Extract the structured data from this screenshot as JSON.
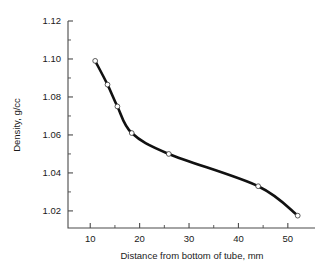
{
  "chart_data": {
    "type": "line",
    "title": "",
    "xlabel": "Distance from bottom of tube, mm",
    "ylabel": "Density, g/cc",
    "xlim": [
      5.5,
      55.5
    ],
    "ylim": [
      1.011,
      1.12
    ],
    "grid": false,
    "legend": null,
    "marker": "open-circle",
    "line_color": "#111111",
    "marker_face_color": "#ffffff",
    "marker_edge_color": "#333333",
    "xticks": [
      10,
      20,
      30,
      40,
      50
    ],
    "xtick_labels": [
      "10",
      "20",
      "30",
      "40",
      "50"
    ],
    "xminor_ticks": [
      15,
      25,
      35,
      45
    ],
    "yticks": [
      1.02,
      1.04,
      1.06,
      1.08,
      1.1,
      1.12
    ],
    "ytick_labels": [
      "1.02",
      "1.04",
      "1.06",
      "1.08",
      "1.10",
      "1.12"
    ],
    "yminor_ticks": [
      1.03,
      1.05,
      1.07,
      1.09,
      1.11
    ],
    "x": [
      11.0,
      13.5,
      15.5,
      18.4,
      25.9,
      44.0,
      52.0
    ],
    "values": [
      1.099,
      1.0865,
      1.075,
      1.061,
      1.05,
      1.033,
      1.0175
    ],
    "series": [
      {
        "name": "Density profile",
        "x": [
          11.0,
          13.5,
          15.5,
          18.4,
          25.9,
          44.0,
          52.0
        ],
        "values": [
          1.099,
          1.0865,
          1.075,
          1.061,
          1.05,
          1.033,
          1.0175
        ]
      }
    ],
    "points": [
      {
        "x": 11.0,
        "y": 1.099
      },
      {
        "x": 13.5,
        "y": 1.0865
      },
      {
        "x": 15.5,
        "y": 1.075
      },
      {
        "x": 18.4,
        "y": 1.061
      },
      {
        "x": 25.9,
        "y": 1.05
      },
      {
        "x": 44.0,
        "y": 1.033
      },
      {
        "x": 52.0,
        "y": 1.0175
      }
    ]
  }
}
